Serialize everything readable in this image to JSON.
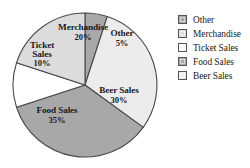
{
  "chart_data": {
    "type": "pie",
    "title": "",
    "subtitle": "",
    "xlabel": "",
    "ylabel": "",
    "legend_position": "right",
    "grid": false,
    "units": "percent",
    "categories": [
      "Other",
      "Beer Sales",
      "Food Sales",
      "Ticket Sales",
      "Merchandise"
    ],
    "values": [
      5,
      30,
      35,
      10,
      20
    ],
    "start_angle_deg": 0,
    "direction": "clockwise",
    "slices": [
      {
        "label": "Other",
        "value": 5,
        "value_text": "5%",
        "color": "#a8a8a8",
        "label_lines": [
          "Other"
        ],
        "label_x": 122,
        "label_y": 38
      },
      {
        "label": "Beer Sales",
        "value": 30,
        "value_text": "30%",
        "color": "#ececec",
        "label_lines": [
          "Beer Sales"
        ],
        "label_x": 119,
        "label_y": 95
      },
      {
        "label": "Food Sales",
        "value": 35,
        "value_text": "35%",
        "color": "#a8a8a8",
        "label_lines": [
          "Food Sales"
        ],
        "label_x": 57,
        "label_y": 115
      },
      {
        "label": "Ticket Sales",
        "value": 10,
        "value_text": "10%",
        "color": "#ffffff",
        "label_lines": [
          "Ticket",
          "Sales"
        ],
        "label_x": 42,
        "label_y": 55
      },
      {
        "label": "Merchandise",
        "value": 20,
        "value_text": "20%",
        "color": "#dcdcdc",
        "label_lines": [
          "Merchandise"
        ],
        "label_x": 83,
        "label_y": 32
      }
    ],
    "legend": [
      {
        "label": "Other",
        "color": "#a8a8a8"
      },
      {
        "label": "Merchandise",
        "color": "#dcdcdc"
      },
      {
        "label": "Ticket Sales",
        "color": "#ffffff"
      },
      {
        "label": "Food Sales",
        "color": "#a8a8a8"
      },
      {
        "label": "Beer Sales",
        "color": "#ececec"
      }
    ],
    "geometry": {
      "center_x": 85,
      "center_y": 85,
      "radius": 72
    },
    "colors": {
      "outline": "#4a4a4a",
      "background": "#ffffff",
      "text": "#1a1a1a"
    }
  }
}
